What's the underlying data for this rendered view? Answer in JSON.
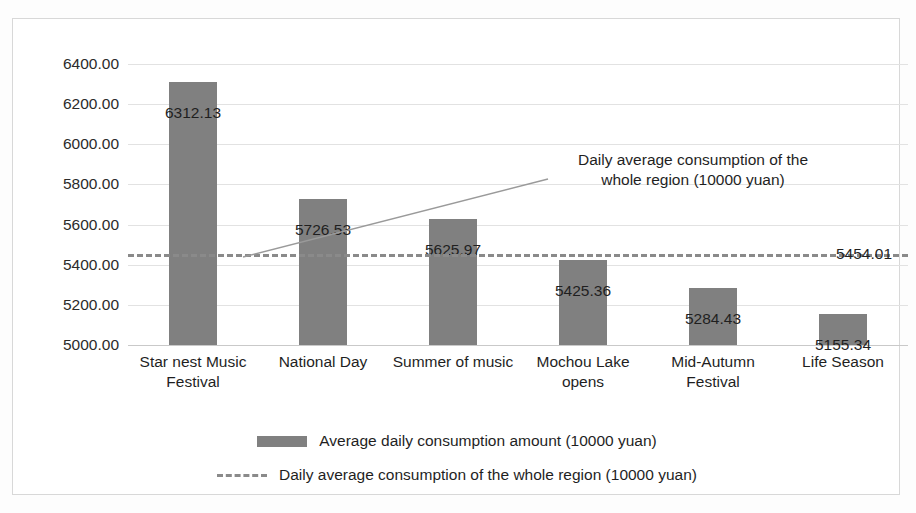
{
  "chart_data": {
    "type": "bar",
    "title": "",
    "subtitle": "",
    "xlabel": "",
    "ylabel": "",
    "ylim": [
      5000,
      6400
    ],
    "ytick_step": 200,
    "yticks": [
      "6400.00",
      "6200.00",
      "6000.00",
      "5800.00",
      "5600.00",
      "5400.00",
      "5200.00",
      "5000.00"
    ],
    "grid": true,
    "legend_position": "bottom",
    "categories": [
      "Star nest Music Festival",
      "National Day",
      "Summer of music",
      "Mochou Lake opens",
      "Mid-Autumn Festival",
      "Life Season"
    ],
    "series": [
      {
        "name": "Average daily consumption amount (10000 yuan)",
        "type": "bar",
        "color": "#808080",
        "values": [
          6312.13,
          5726.53,
          5625.97,
          5425.36,
          5284.43,
          5155.34
        ],
        "labels": [
          "6312.13",
          "5726.53",
          "5625.97",
          "5425.36",
          "5284.43",
          "5155.34"
        ]
      },
      {
        "name": "Daily average consumption of the whole region (10000 yuan)",
        "type": "line",
        "style": "dashed",
        "color": "#8a8a8a",
        "value": 5454.01,
        "value_label": "5454.01"
      }
    ],
    "annotations": [
      {
        "text": "Daily average consumption of the whole region (10000 yuan)",
        "line1": "Daily average consumption of the",
        "line2": "whole region (10000 yuan)",
        "has_leader_line": true
      }
    ]
  },
  "legend": {
    "items": [
      {
        "label": "Average daily consumption amount (10000 yuan)",
        "marker": "bar-swatch"
      },
      {
        "label": "Daily average consumption of the whole region (10000 yuan)",
        "marker": "dashed-line-swatch"
      }
    ]
  },
  "colors": {
    "bar": "#808080",
    "average_line": "#8a8a8a",
    "gridline": "#e2e2e2",
    "frame": "#d8d8d8",
    "text": "#1f1f1f",
    "background": "#ffffff"
  }
}
